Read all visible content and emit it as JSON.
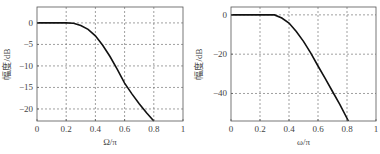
{
  "chart_data": [
    {
      "type": "line",
      "title": "",
      "xlabel": "Ω/π",
      "ylabel": "幅度/dB",
      "xlim": [
        0,
        1
      ],
      "ylim": [
        -22.8,
        3.7
      ],
      "xticks": [
        0,
        0.2,
        0.4,
        0.6,
        0.8,
        1
      ],
      "xtick_labels": [
        "0",
        "0.2",
        "0.4",
        "0.6",
        "0.8",
        "1"
      ],
      "yticks": [
        0,
        -5,
        -10,
        -15,
        -20
      ],
      "ytick_labels": [
        "0",
        "-5",
        "-10",
        "-15",
        "-20"
      ],
      "grid": true,
      "grid_style": "dashed",
      "series": [
        {
          "name": "magnitude",
          "color": "#111111",
          "x": [
            0,
            0.1,
            0.2,
            0.25,
            0.3,
            0.35,
            0.4,
            0.45,
            0.5,
            0.55,
            0.6,
            0.65,
            0.7,
            0.75,
            0.8
          ],
          "y": [
            0,
            0,
            0,
            -0.1,
            -0.6,
            -1.5,
            -3.0,
            -5.2,
            -7.8,
            -10.8,
            -14.0,
            -16.5,
            -18.8,
            -20.9,
            -22.8
          ]
        }
      ]
    },
    {
      "type": "line",
      "title": "",
      "xlabel": "ω/π",
      "ylabel": "幅度/dB",
      "xlim": [
        0,
        1
      ],
      "ylim": [
        -54,
        4
      ],
      "xticks": [
        0,
        0.2,
        0.4,
        0.6,
        0.8,
        1
      ],
      "xtick_labels": [
        "0",
        "0.2",
        "0.4",
        "0.6",
        "0.8",
        "1"
      ],
      "yticks": [
        0,
        -20,
        -40
      ],
      "ytick_labels": [
        "0",
        "-20",
        "-40"
      ],
      "grid": true,
      "grid_style": "dashed",
      "series": [
        {
          "name": "magnitude",
          "color": "#111111",
          "x": [
            0,
            0.1,
            0.2,
            0.3,
            0.35,
            0.4,
            0.45,
            0.5,
            0.55,
            0.6,
            0.65,
            0.7,
            0.75,
            0.81
          ],
          "y": [
            0,
            0,
            0,
            0,
            -1.6,
            -4.2,
            -8.5,
            -13.5,
            -19.5,
            -26.0,
            -32.5,
            -39.0,
            -45.5,
            -54.0
          ]
        }
      ]
    }
  ]
}
